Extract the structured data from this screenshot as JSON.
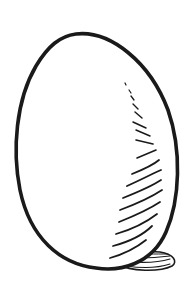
{
  "illustration": {
    "subject": "egg",
    "style": "black ink line drawing with hatched shading",
    "alt_text": "Hand-drawn egg with hatched shading and a small shadow"
  },
  "colors": {
    "background": "#ffffff",
    "ink": "#1a1a1a"
  }
}
